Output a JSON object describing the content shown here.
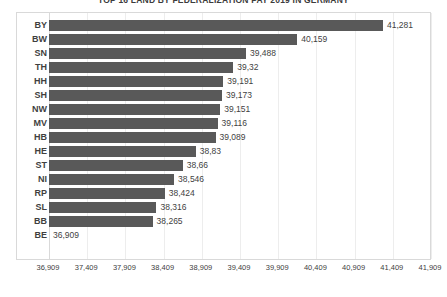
{
  "chart_data": {
    "type": "bar",
    "orientation": "horizontal",
    "title": "TOP 16 LAND BY FEDERALIZATION PAY 2019 IN GERMANY",
    "xlabel": "",
    "ylabel": "",
    "categories": [
      "BY",
      "BW",
      "SN",
      "TH",
      "HH",
      "SH",
      "NW",
      "MV",
      "HB",
      "HE",
      "ST",
      "NI",
      "RP",
      "SL",
      "BB",
      "BE"
    ],
    "values": [
      41281,
      40159,
      39488,
      39320,
      39191,
      39173,
      39151,
      39116,
      39089,
      38830,
      38660,
      38546,
      38424,
      38316,
      38265,
      36909
    ],
    "value_labels": [
      "41,281",
      "40,159",
      "39,488",
      "39,32",
      "39,191",
      "39,173",
      "39,151",
      "39,116",
      "39,089",
      "38,83",
      "38,66",
      "38,546",
      "38,424",
      "38,316",
      "38,265",
      "36,909"
    ],
    "xlim": [
      36909,
      41909
    ],
    "xticks": [
      36909,
      37409,
      37909,
      38409,
      38909,
      39409,
      39909,
      40409,
      40909,
      41409,
      41909
    ],
    "xtick_labels": [
      "36,909",
      "37,409",
      "37,909",
      "38,409",
      "38,909",
      "39,409",
      "39,909",
      "40,409",
      "40,909",
      "41,409",
      "41,909"
    ],
    "grid": true,
    "grid_axis": "x",
    "legend": false,
    "bar_color": "#595959",
    "gridline_color": "#ededed",
    "plot_border_color": "#d9d9d9",
    "text_color": "#404040",
    "background": "#ffffff"
  }
}
